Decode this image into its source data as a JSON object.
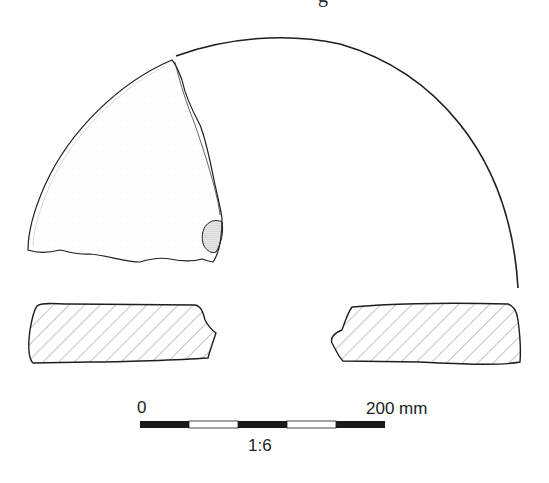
{
  "figure": {
    "caption_fragment": "g",
    "plan_view": {
      "label": "sherd-plan-view",
      "rim_arc": {
        "start": [
          176,
          56
        ],
        "peak": [
          270,
          37
        ],
        "end": [
          518,
          288
        ]
      }
    },
    "sections": [
      {
        "label": "section-left"
      },
      {
        "label": "section-right"
      }
    ],
    "scale_bar": {
      "start_label": "0",
      "end_label": "200 mm",
      "ratio": "1:6",
      "segments": [
        "black",
        "white",
        "black",
        "white",
        "black"
      ]
    },
    "colors": {
      "line": "#1e1e1e",
      "hatch": "#8a8a8a",
      "stipple": "#9a9a9a",
      "background": "#ffffff"
    }
  }
}
